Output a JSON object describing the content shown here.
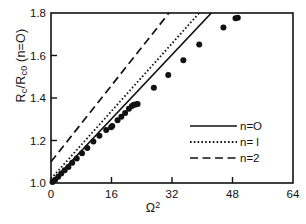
{
  "chart_data": {
    "type": "scatter",
    "title": "",
    "xlabel": "Ω²",
    "ylabel": "R_c / R_c0 (n=O)",
    "xlabel_parts": {
      "base": "Ω",
      "sup": "2"
    },
    "ylabel_parts": {
      "r1": "R",
      "sub1": "c",
      "slash": "/",
      "r2": "R",
      "sub2": "c0",
      "paren": "(n=O)"
    },
    "xlim": [
      0,
      64
    ],
    "ylim": [
      1.0,
      1.8
    ],
    "xticks": [
      0,
      16,
      32,
      48,
      64
    ],
    "xtick_labels": [
      "0",
      "16",
      "32",
      "48",
      "64"
    ],
    "yticks": [
      1.0,
      1.2,
      1.4,
      1.6,
      1.8
    ],
    "ytick_labels": [
      "1.0",
      "1.2",
      "1.4",
      "1.6",
      "1.8"
    ],
    "grid": false,
    "tick_direction": "in",
    "frame": "box",
    "legend_position": "center-right",
    "marker": {
      "shape": "filled-circle",
      "color": "#111111",
      "size": 5.2
    },
    "series": [
      {
        "name": "n=0",
        "style": "solid",
        "type": "line",
        "color": "#111111",
        "x": [
          0.0,
          42.4
        ],
        "y": [
          1.0,
          1.8
        ]
      },
      {
        "name": "n=1",
        "style": "dotted",
        "type": "line",
        "color": "#111111",
        "x": [
          0.0,
          39.2
        ],
        "y": [
          1.02,
          1.8
        ]
      },
      {
        "name": "n=2",
        "style": "dashed",
        "type": "line",
        "color": "#111111",
        "x": [
          0.0,
          31.2
        ],
        "y": [
          1.1,
          1.8
        ]
      },
      {
        "name": "data",
        "type": "scatter",
        "color": "#111111",
        "points": [
          [
            0.4,
            1.005
          ],
          [
            1.1,
            1.015
          ],
          [
            1.9,
            1.03
          ],
          [
            2.7,
            1.045
          ],
          [
            3.6,
            1.06
          ],
          [
            4.6,
            1.075
          ],
          [
            5.6,
            1.095
          ],
          [
            6.8,
            1.115
          ],
          [
            8.2,
            1.14
          ],
          [
            9.6,
            1.165
          ],
          [
            11.2,
            1.195
          ],
          [
            12.8,
            1.222
          ],
          [
            14.6,
            1.25
          ],
          [
            15.9,
            1.262
          ],
          [
            16.2,
            1.268
          ],
          [
            17.6,
            1.295
          ],
          [
            18.6,
            1.312
          ],
          [
            19.6,
            1.33
          ],
          [
            20.6,
            1.35
          ],
          [
            21.4,
            1.362
          ],
          [
            21.9,
            1.368
          ],
          [
            22.4,
            1.37
          ],
          [
            22.9,
            1.372
          ],
          [
            27.2,
            1.448
          ],
          [
            31.0,
            1.508
          ],
          [
            35.0,
            1.578
          ],
          [
            39.2,
            1.652
          ],
          [
            45.6,
            1.732
          ],
          [
            48.8,
            1.775
          ],
          [
            49.4,
            1.778
          ]
        ]
      }
    ],
    "legend_entries": [
      {
        "label": "n=O",
        "style": "solid"
      },
      {
        "label": "n= l",
        "style": "dotted"
      },
      {
        "label": "n=2",
        "style": "dashed"
      }
    ]
  }
}
